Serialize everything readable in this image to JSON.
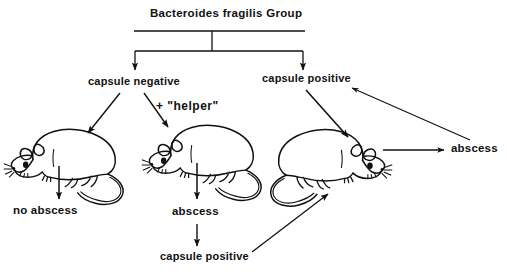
{
  "figure": {
    "kind": "flow-diagram",
    "ink_color": "#111111",
    "background_color": "#ffffff"
  },
  "title": {
    "text": "Bacteroides fragilis Group"
  },
  "nodes": {
    "capsule_negative": "capsule negative",
    "capsule_positive_top": "capsule positive",
    "helper": "+ \"helper\"",
    "no_abscess": "no abscess",
    "abscess_middle": "abscess",
    "capsule_positive_bottom": "capsule positive",
    "abscess_right": "abscess"
  },
  "animals": [
    {
      "name": "mouse-left",
      "facing": "left"
    },
    {
      "name": "mouse-middle",
      "facing": "left"
    },
    {
      "name": "mouse-right",
      "facing": "right"
    }
  ],
  "edges": [
    {
      "from": "Bacteroides fragilis Group",
      "to": "capsule negative"
    },
    {
      "from": "Bacteroides fragilis Group",
      "to": "capsule positive"
    },
    {
      "from": "capsule negative",
      "to": "mouse-left"
    },
    {
      "from": "capsule negative",
      "to": "mouse-middle",
      "label": "+ \"helper\""
    },
    {
      "from": "mouse-left",
      "to": "no abscess"
    },
    {
      "from": "mouse-middle",
      "to": "abscess"
    },
    {
      "from": "abscess",
      "to": "capsule positive"
    },
    {
      "from": "capsule positive",
      "to": "mouse-right"
    },
    {
      "from": "capsule positive (top)",
      "to": "mouse-right"
    },
    {
      "from": "mouse-right",
      "to": "abscess"
    },
    {
      "from": "abscess",
      "to": "capsule positive (top)"
    }
  ]
}
